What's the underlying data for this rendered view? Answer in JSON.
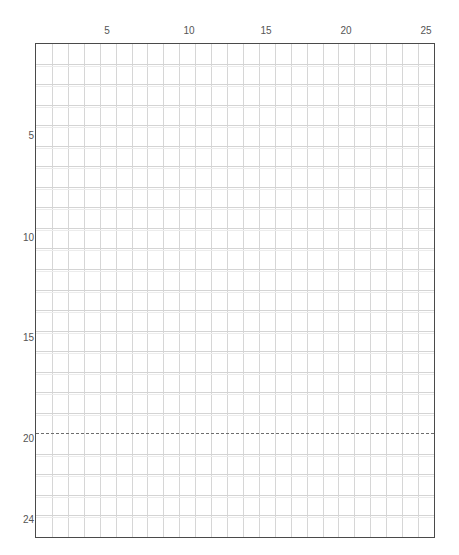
{
  "grid": {
    "columns": 25,
    "rows": 24,
    "line_color": "#d6d6d6",
    "border_color": "#4a4a4a",
    "dashed_line_color": "#6e6e6e",
    "dashed_line_after_row": 19
  },
  "column_labels": [
    {
      "col": 5,
      "text": "5"
    },
    {
      "col": 10,
      "text": "10"
    },
    {
      "col": 15,
      "text": "15"
    },
    {
      "col": 20,
      "text": "20"
    },
    {
      "col": 25,
      "text": "25"
    }
  ],
  "row_labels": [
    {
      "row": 5,
      "text": "5"
    },
    {
      "row": 10,
      "text": "10"
    },
    {
      "row": 15,
      "text": "15"
    },
    {
      "row": 20,
      "text": "20"
    },
    {
      "row": 24,
      "text": "24"
    }
  ],
  "labels": {
    "col_5": "5",
    "col_10": "10",
    "col_15": "15",
    "col_20": "20",
    "col_25": "25",
    "row_5": "5",
    "row_10": "10",
    "row_15": "15",
    "row_20": "20",
    "row_24": "24"
  }
}
